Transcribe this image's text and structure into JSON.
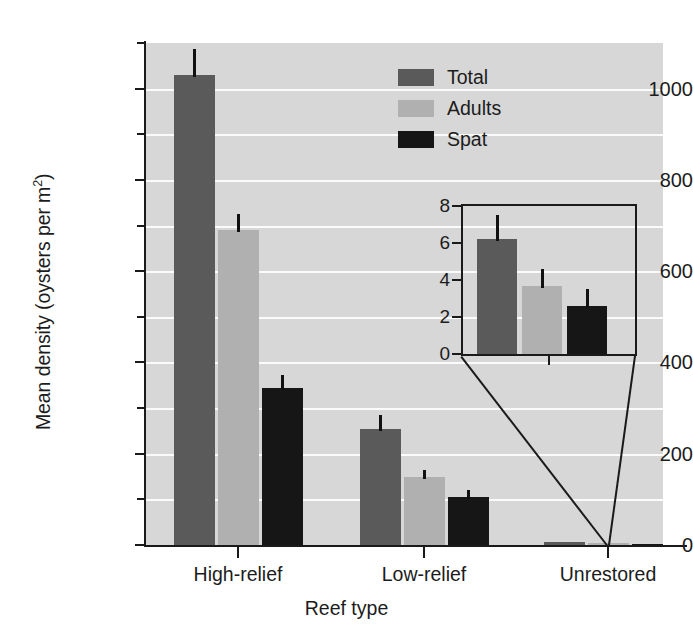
{
  "chart_data": {
    "type": "bar",
    "title": "",
    "xlabel": "Reef type",
    "ylabel": "Mean density (oysters per m2)",
    "ylabel_text": "Mean density (oysters per m",
    "ylabel_sup": "2",
    "ylabel_tail": ")",
    "categories": [
      "High-relief",
      "Low-relief",
      "Unrestored"
    ],
    "series": [
      {
        "name": "Total",
        "color": "#5a5a5a",
        "values": [
          1030,
          255,
          6.2
        ],
        "errors": [
          57,
          30,
          1.3
        ]
      },
      {
        "name": "Adults",
        "color": "#b0b0b0",
        "values": [
          690,
          150,
          3.7
        ],
        "errors": [
          35,
          15,
          0.9
        ]
      },
      {
        "name": "Spat",
        "color": "#161616",
        "values": [
          345,
          105,
          2.6
        ],
        "errors": [
          27,
          15,
          0.9
        ]
      }
    ],
    "ylim": [
      0,
      1100
    ],
    "yticks": [
      0,
      200,
      400,
      600,
      800,
      1000
    ],
    "yticklabels": [
      "0",
      "200",
      "400",
      "600",
      "800",
      "1000"
    ],
    "yminorticks": [
      100,
      300,
      500,
      700,
      900,
      1100
    ],
    "gridlines": [
      100,
      200,
      300,
      400,
      500,
      600,
      700,
      800,
      900,
      1000
    ],
    "grid": true,
    "legend_position": "top-right",
    "plot_background": "#d7d7d7",
    "gridline_color": "#fbfbfb",
    "inset": {
      "type": "bar",
      "categories": [
        "Unrestored"
      ],
      "series_names": [
        "Total",
        "Adults",
        "Spat"
      ],
      "values": [
        6.2,
        3.7,
        2.6
      ],
      "errors": [
        1.3,
        0.9,
        0.9
      ],
      "ylim": [
        0,
        8
      ],
      "yticks": [
        0,
        2,
        4,
        6,
        8
      ],
      "yticklabels": [
        "0",
        "2",
        "4",
        "6",
        "8"
      ]
    }
  },
  "legend": {
    "items": [
      {
        "label": "Total",
        "color": "#5a5a5a"
      },
      {
        "label": "Adults",
        "color": "#b0b0b0"
      },
      {
        "label": "Spat",
        "color": "#161616"
      }
    ]
  },
  "axes": {
    "y_title_main": "Mean density (oysters per m",
    "y_title_sup": "2",
    "y_title_tail": ")",
    "x_title": "Reef type",
    "y_tick_labels": [
      "1000",
      "800",
      "600",
      "400",
      "200",
      "0"
    ],
    "x_tick_labels": [
      "High-relief",
      "Low-relief",
      "Unrestored"
    ],
    "inset_y_tick_labels": [
      "8",
      "6",
      "4",
      "2",
      "0"
    ]
  }
}
